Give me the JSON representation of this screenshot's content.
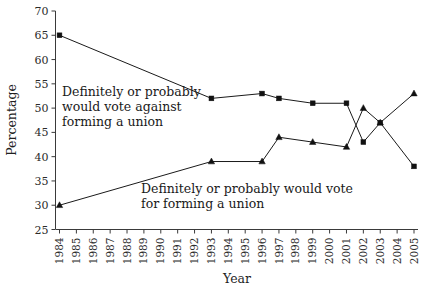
{
  "chart_data": {
    "type": "line",
    "title": "",
    "xlabel": "Year",
    "ylabel": "Percentage",
    "grid": false,
    "legend_position": "in-plot-annotations",
    "xlim": [
      1984,
      2005
    ],
    "ylim": [
      25,
      70
    ],
    "ytick_step": 5,
    "yticks": [
      25,
      30,
      35,
      40,
      45,
      50,
      55,
      60,
      65,
      70
    ],
    "xticks": [
      "1984",
      "1985",
      "1986",
      "1987",
      "1988",
      "1989",
      "1990",
      "1991",
      "1992",
      "1993",
      "1994",
      "1995",
      "1996",
      "1997",
      "1998",
      "1999",
      "2000",
      "2001",
      "2002",
      "2003",
      "2004",
      "2005"
    ],
    "categories": [
      1984,
      1993,
      1996,
      1997,
      1999,
      2001,
      2002,
      2003,
      2005
    ],
    "series": [
      {
        "name": "Definitely or probably would vote against forming a union",
        "marker": "square",
        "color": "#111111",
        "x": [
          1984,
          1993,
          1996,
          1997,
          1999,
          2001,
          2002,
          2003,
          2005
        ],
        "values": [
          65,
          52,
          53,
          52,
          51,
          51,
          43,
          47,
          38
        ]
      },
      {
        "name": "Definitely or probably would vote for forming a union",
        "marker": "triangle",
        "color": "#111111",
        "x": [
          1984,
          1993,
          1996,
          1997,
          1999,
          2001,
          2002,
          2003,
          2005
        ],
        "values": [
          30,
          39,
          39,
          44,
          43,
          42,
          50,
          47,
          53
        ]
      }
    ],
    "annotations": [
      {
        "id": "annotation-against",
        "lines": [
          "Definitely or probably",
          "would vote against",
          "forming a union"
        ]
      },
      {
        "id": "annotation-for",
        "lines": [
          "Definitely or probably would vote",
          "for forming a union"
        ]
      }
    ]
  }
}
